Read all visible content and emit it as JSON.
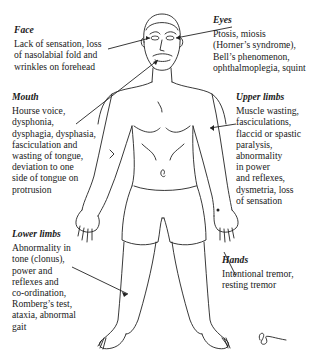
{
  "diagram": {
    "annotations": [
      {
        "id": "face",
        "title": "Face",
        "body": "Lack of sensation, loss\nof nasolabial fold and\nwrinkles on forehead"
      },
      {
        "id": "eyes",
        "title": "Eyes",
        "body": "Ptosis, miosis\n(Horner’s syndrome),\nBell’s phenomenon,\nophthalmoplegia, squint"
      },
      {
        "id": "mouth",
        "title": "Mouth",
        "body": "Hourse voice,\ndysphonia,\ndysphagia, dysphasia,\nfasciculation and\nwasting of tongue,\ndeviation to one\nside of tongue on\nprotrusion"
      },
      {
        "id": "upper_limbs",
        "title": "Upper limbs",
        "body": "Muscle wasting,\nfasciculations,\nflaccid or spastic\nparalysis,\nabnormality\nin power\nand reflexes,\ndysmetria, loss\nof sensation"
      },
      {
        "id": "lower_limbs",
        "title": "Lower limbs",
        "body": "Abnormality in\ntone (clonus),\npower and\nreflexes and\nco-ordination,\nRomberg’s test,\nataxia, abnormal\ngait"
      },
      {
        "id": "hands",
        "title": "Hands",
        "body": "Intentional tremor,\nresting tremor"
      }
    ],
    "colors": {
      "ink": "#222222",
      "background": "#ffffff"
    }
  }
}
